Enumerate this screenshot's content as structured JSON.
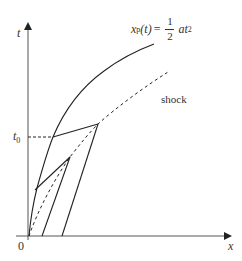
{
  "figure": {
    "type": "spacetime-diagram",
    "axes": {
      "x_label": "x",
      "y_label": "t",
      "origin_label": "0"
    },
    "marked_time": {
      "label_base": "t",
      "label_sub": "0"
    },
    "particle_path": {
      "lhs_var": "x",
      "lhs_sub": "p",
      "lhs_arg": "(t)",
      "equals": "=",
      "frac_num": "1",
      "frac_den": "2",
      "rhs_var": "at",
      "rhs_exp": "2",
      "style": "solid"
    },
    "shock": {
      "label": "shock",
      "style": "dashed"
    },
    "characteristics": [
      {
        "from": "particle path at t0",
        "to": "shock",
        "then": "straight line to x-axis",
        "style": "solid"
      },
      {
        "from": "particle path (lower)",
        "to": "shock",
        "then": "straight line to x-axis",
        "style": "solid"
      }
    ],
    "colors": {
      "line": "#222222",
      "axis": "#444444",
      "background": "#ffffff"
    }
  }
}
